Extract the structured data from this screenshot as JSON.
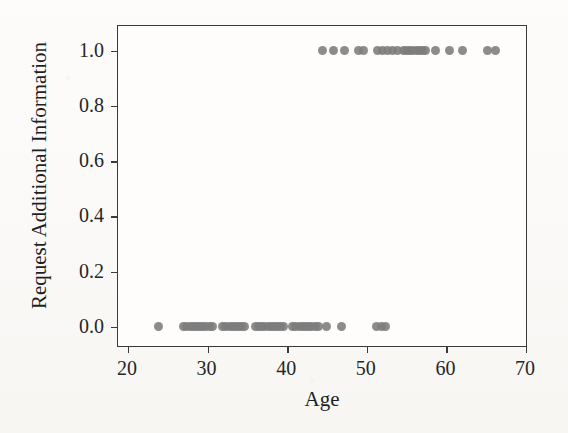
{
  "chart_data": {
    "type": "scatter",
    "title": "",
    "xlabel": "Age",
    "ylabel": "Request Additional Information",
    "xlim": [
      18.75,
      70
    ],
    "ylim": [
      -0.07,
      1.09
    ],
    "xticks": [
      20,
      30,
      40,
      50,
      60,
      70
    ],
    "xticklabels": [
      "20",
      "30",
      "40",
      "50",
      "60",
      "70"
    ],
    "yticks": [
      0.0,
      0.2,
      0.4,
      0.6,
      0.8,
      1.0
    ],
    "yticklabels": [
      "0.0",
      "0.2",
      "0.4",
      "0.6",
      "0.8",
      "1.0"
    ],
    "grid": false,
    "legend": null,
    "marker_color": "#7c7c7c",
    "axis_color": "#3a3a3a",
    "background_color": "#fbfaf8",
    "series": [
      {
        "name": "Request Additional Information = 0",
        "y": 0.0,
        "x": [
          23.8,
          27.0,
          27.4,
          27.8,
          28.2,
          28.6,
          29.0,
          29.4,
          29.8,
          30.2,
          30.6,
          31.9,
          32.3,
          32.7,
          33.1,
          33.5,
          33.9,
          34.3,
          34.7,
          36.0,
          36.4,
          36.8,
          37.2,
          37.6,
          38.0,
          38.4,
          38.8,
          39.2,
          39.6,
          40.7,
          41.1,
          41.5,
          41.9,
          42.3,
          42.7,
          43.1,
          43.5,
          43.9,
          45.0,
          46.8,
          51.2,
          51.8,
          52.4
        ]
      },
      {
        "name": "Request Additional Information = 1",
        "y": 1.0,
        "x": [
          44.4,
          45.8,
          47.2,
          49.0,
          49.6,
          51.4,
          52.0,
          52.6,
          53.2,
          53.8,
          54.6,
          55.0,
          55.4,
          55.8,
          56.2,
          56.6,
          57.0,
          57.4,
          58.6,
          60.4,
          62.0,
          65.2,
          66.2
        ]
      }
    ]
  }
}
